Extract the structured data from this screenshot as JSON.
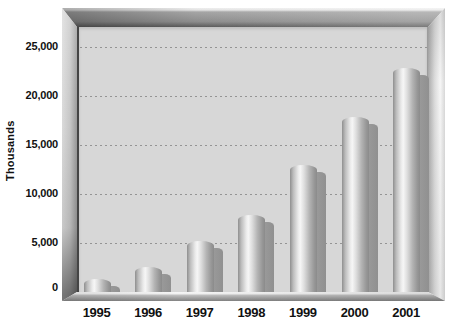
{
  "chart_data": {
    "type": "bar",
    "title": "",
    "xlabel": "",
    "ylabel": "Thousands",
    "categories": [
      "1995",
      "1996",
      "1997",
      "1998",
      "1999",
      "2000",
      "2001"
    ],
    "values": [
      1300,
      2600,
      5200,
      7900,
      13000,
      17900,
      22900
    ],
    "y_ticks": [
      {
        "label": "25,000",
        "value": 25000
      },
      {
        "label": "20,000",
        "value": 20000
      },
      {
        "label": "15,000",
        "value": 15000
      },
      {
        "label": "10,000",
        "value": 10000
      },
      {
        "label": "5,000",
        "value": 5000
      },
      {
        "label": "0",
        "value": 0
      }
    ],
    "ylim": [
      0,
      27000
    ],
    "gridlines": {
      "style": "dotted",
      "orientation": "horizontal",
      "at": [
        5000,
        10000,
        15000,
        20000,
        25000
      ]
    },
    "legend": "none",
    "bar_style": "3d-cylinder-with-shadow",
    "frame_style": "beveled-metallic-3d-frame"
  },
  "colors": {
    "page_bg": "#ffffff",
    "plot_bg": "#d7d7d7",
    "gridline": "#949494",
    "axis_line": "#454545",
    "bar_highlight": "#f6f6f6",
    "bar_edge": "#8f8f8f",
    "bar_shadow": "#9c9c9c",
    "frame_top": "#8f8f8f",
    "frame_left": "#c5c5c5",
    "frame_right": "#e8e8e8",
    "frame_floor": "#9a9a9a",
    "text": "#111111"
  }
}
